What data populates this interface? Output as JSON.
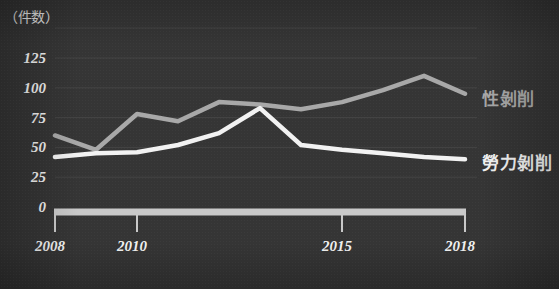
{
  "figure": {
    "background_color": "#353535",
    "axis_color": "#c9c9c9",
    "grid_color": "#454545",
    "tick_text_color": "#f0f0f0"
  },
  "axes": {
    "y_unit_label": "（件数）",
    "y_ticks": [
      "0",
      "25",
      "50",
      "75",
      "100",
      "125"
    ],
    "x_ticks": [
      "2008",
      "2010",
      "2015",
      "2018"
    ]
  },
  "legend": {
    "items": [
      {
        "label": "性剝削",
        "color": "#a8a8a8"
      },
      {
        "label": "勞力剝削",
        "color": "#f2f2f2"
      }
    ]
  },
  "chart_data": {
    "type": "line",
    "title": "",
    "xlabel": "",
    "ylabel": "件数",
    "xlim": [
      2008,
      2018
    ],
    "ylim": [
      0,
      135
    ],
    "yticks": [
      0,
      25,
      50,
      75,
      100,
      125
    ],
    "xticks": [
      2008,
      2010,
      2015,
      2018
    ],
    "grid": true,
    "legend_position": "right",
    "x": [
      2008,
      2009,
      2010,
      2011,
      2012,
      2013,
      2014,
      2015,
      2016,
      2017,
      2018
    ],
    "series": [
      {
        "name": "性剝削",
        "color": "#a8a8a8",
        "values": [
          60,
          48,
          78,
          72,
          88,
          86,
          82,
          88,
          98,
          110,
          95
        ]
      },
      {
        "name": "勞力剝削",
        "color": "#f2f2f2",
        "values": [
          42,
          45,
          46,
          52,
          62,
          83,
          52,
          48,
          45,
          42,
          40
        ]
      }
    ]
  }
}
